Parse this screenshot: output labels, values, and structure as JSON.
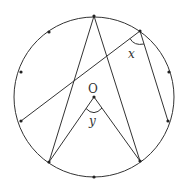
{
  "diagram": {
    "type": "circle-geometry",
    "stroke_color": "#333333",
    "background": "#ffffff",
    "circle": {
      "cx": 94,
      "cy": 97,
      "r": 80
    },
    "points": {
      "A": {
        "x": 94,
        "y": 16
      },
      "P": {
        "x": 140,
        "y": 31
      },
      "R1": {
        "x": 169,
        "y": 72
      },
      "Q": {
        "x": 168,
        "y": 121
      },
      "C": {
        "x": 140,
        "y": 161
      },
      "D": {
        "x": 94,
        "y": 177
      },
      "B": {
        "x": 49,
        "y": 162
      },
      "L": {
        "x": 21,
        "y": 121
      },
      "L1": {
        "x": 21,
        "y": 72
      },
      "U1": {
        "x": 49,
        "y": 32
      },
      "O": {
        "x": 94,
        "y": 97
      }
    },
    "segments": [
      [
        "A",
        "B"
      ],
      [
        "A",
        "C"
      ],
      [
        "L",
        "P"
      ],
      [
        "P",
        "Q"
      ],
      [
        "O",
        "B"
      ],
      [
        "O",
        "C"
      ]
    ],
    "labels": {
      "center": "O",
      "angle_x": "x",
      "angle_y": "y"
    }
  }
}
